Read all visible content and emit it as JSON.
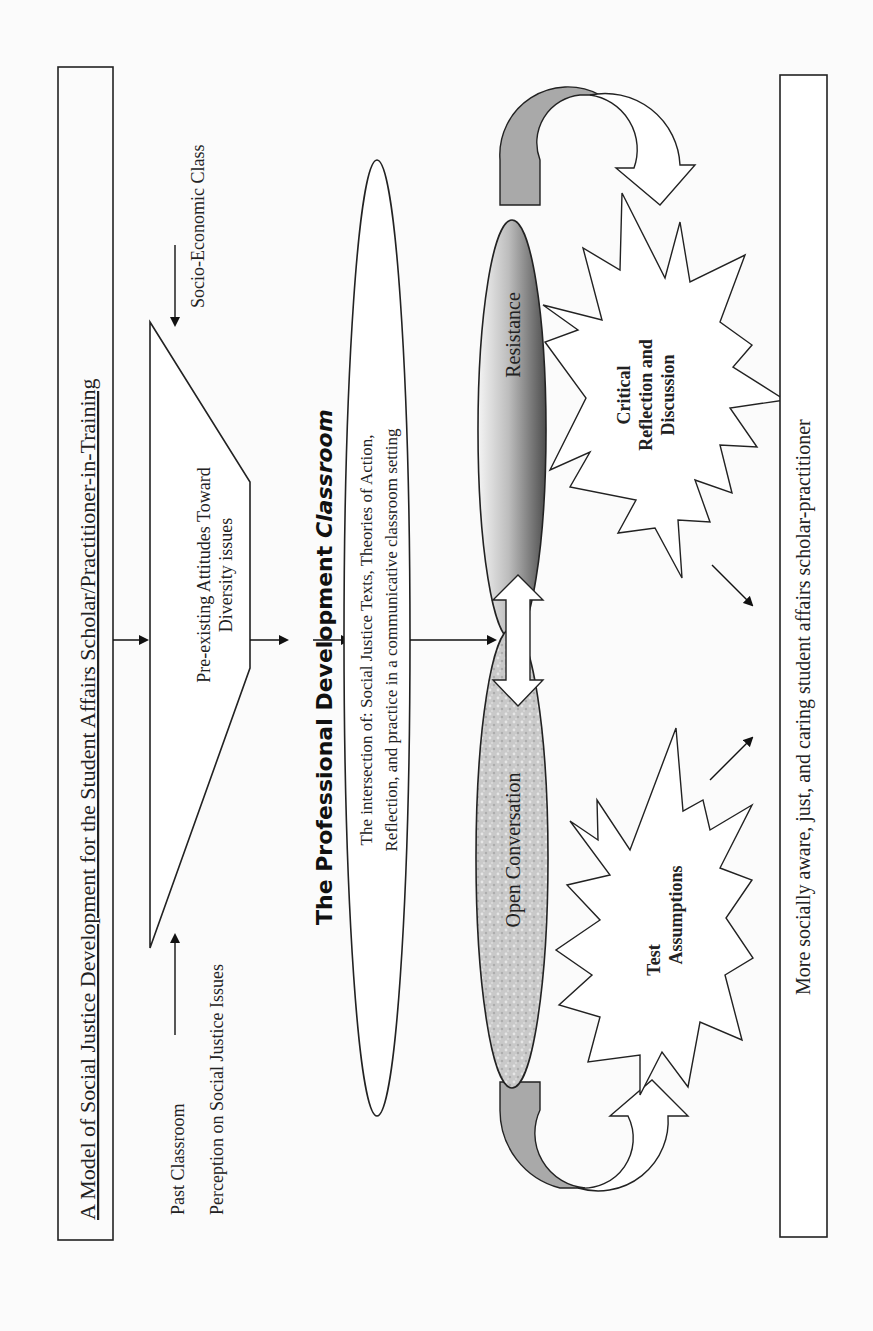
{
  "diagram": {
    "title": "A Model of Social Justice Development for the Student Affairs Scholar/Practitioner-in-Training",
    "inputs": {
      "past_classroom": "Past Classroom",
      "perception": "Perception on Social Justice Issues",
      "socio_economic": "Socio-Economic Class"
    },
    "pre_existing": {
      "line1": "Pre-existing Attitudes Toward",
      "line2": "Diversity issues"
    },
    "classroom_heading": {
      "prefix": "The Professional Development ",
      "emphasis": "Classroom"
    },
    "intersection": {
      "line1": "The intersection of: Social Justice Texts, Theories of Action,",
      "line2": "Reflection, and practice in a communicative classroom setting"
    },
    "resistance": "Resistance",
    "open_conversation": "Open Conversation",
    "critical_reflection": {
      "line1": "Critical",
      "line2": "Reflection and",
      "line3": "Discussion"
    },
    "test_assumptions": {
      "line1": "Test",
      "line2": "Assumptions"
    },
    "outcome": "More socially aware, just, and caring student affairs scholar-practitioner",
    "colors": {
      "stroke": "#222222",
      "curved_arrow_fill": "#a9a9a9",
      "resistance_dark": "#5a5a5a",
      "resistance_light": "#f2f2f2",
      "open_conversation_fill": "#c8c8c8",
      "background": "#fbfbfb"
    }
  }
}
